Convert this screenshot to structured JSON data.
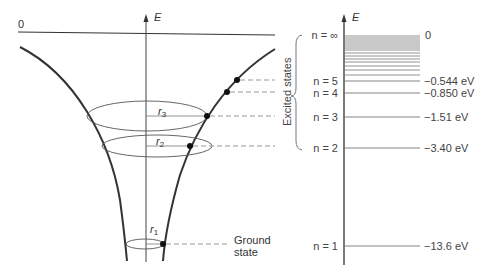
{
  "potential_well": {
    "zero_label": "0",
    "axis_label": "E",
    "radius_labels": [
      {
        "name": "r",
        "sub": "3"
      },
      {
        "name": "r",
        "sub": "2"
      },
      {
        "name": "r",
        "sub": "1"
      }
    ],
    "ground_state_label_line1": "Ground",
    "ground_state_label_line2": "state"
  },
  "bracket": {
    "label": "Excited states"
  },
  "energy_levels": {
    "axis_label": "E",
    "levels": [
      {
        "n_label": "n = ∞",
        "energy": "0"
      },
      {
        "n_label": "n = 5",
        "energy": "−0.544 eV"
      },
      {
        "n_label": "n = 4",
        "energy": "−0.850 eV"
      },
      {
        "n_label": "n = 3",
        "energy": "−1.51 eV"
      },
      {
        "n_label": "n = 2",
        "energy": "−3.40 eV"
      },
      {
        "n_label": "n = 1",
        "energy": "−13.6 eV"
      }
    ]
  }
}
